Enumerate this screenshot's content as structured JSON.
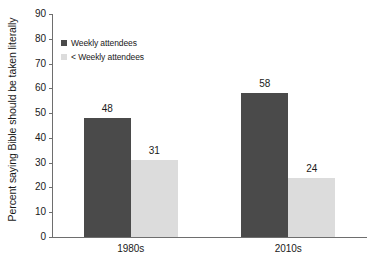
{
  "chart_data": {
    "type": "bar",
    "title": "",
    "xlabel": "",
    "ylabel": "Percent saying Bible should be taken literally",
    "categories": [
      "1980s",
      "2010s"
    ],
    "series": [
      {
        "name": "Weekly attendees",
        "color": "#4a4a4a",
        "values": [
          48,
          58
        ]
      },
      {
        "name": "< Weekly attendees",
        "color": "#dcdcdc",
        "values": [
          31,
          24
        ]
      }
    ],
    "ylim": [
      0,
      90
    ],
    "ytick_step": 10,
    "yticks": [
      0,
      10,
      20,
      30,
      40,
      50,
      60,
      70,
      80,
      90
    ],
    "ytick_labels": [
      "0",
      "10",
      "20",
      "30",
      "40",
      "50",
      "60",
      "70",
      "80",
      "90"
    ],
    "grid": false,
    "legend_position": "top-left",
    "data_labels": [
      "48",
      "31",
      "58",
      "24"
    ]
  },
  "axes": {
    "y_title": "Percent saying Bible should be taken literally",
    "axis_color": "#6e6e6e"
  },
  "legend": {
    "items": [
      {
        "label": "Weekly attendees",
        "color": "#4a4a4a"
      },
      {
        "label": "< Weekly attendees",
        "color": "#dcdcdc"
      }
    ]
  }
}
